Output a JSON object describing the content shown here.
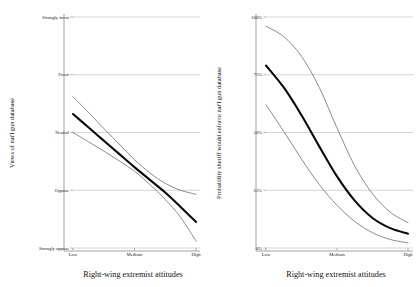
{
  "figure": {
    "background": "#ffffff",
    "fit_color": "#0b0b0b",
    "ci_color": "#7d7d7d",
    "grid_color": "#b9b9b9",
    "axis_color": "#8c8c8c"
  },
  "chart_data": [
    {
      "type": "line",
      "panel": "left",
      "title": "",
      "xlabel": "Right-wing extremist attitudes",
      "ylabel": "Views of nat'l gun database",
      "x": [
        "Low",
        "Medium",
        "High"
      ],
      "xticklabels": [
        "Low",
        "Medium",
        "High"
      ],
      "yticklabels": [
        "Strongly oppose",
        "Oppose",
        "Neutral",
        "Favor",
        "Strongly favor"
      ],
      "ytickvalues": [
        1,
        2,
        3,
        4,
        5
      ],
      "ylim": [
        1,
        5
      ],
      "xlim": [
        0,
        1
      ],
      "grid": "horizontal",
      "legend": "none",
      "series": [
        {
          "name": "Predicted views (fit)",
          "style": "solid-thick-black",
          "x": [
            0.0,
            0.125,
            0.25,
            0.375,
            0.5,
            0.625,
            0.75,
            0.875,
            1.0
          ],
          "values": [
            3.32,
            3.09,
            2.86,
            2.63,
            2.4,
            2.18,
            1.96,
            1.71,
            1.45
          ]
        },
        {
          "name": "95% CI upper",
          "style": "solid-thin-gray",
          "x": [
            0.0,
            0.125,
            0.25,
            0.375,
            0.5,
            0.625,
            0.75,
            0.875,
            1.0
          ],
          "values": [
            3.62,
            3.35,
            3.07,
            2.8,
            2.53,
            2.3,
            2.12,
            2.0,
            1.93
          ]
        },
        {
          "name": "95% CI lower",
          "style": "solid-thin-gray",
          "x": [
            0.0,
            0.125,
            0.25,
            0.375,
            0.5,
            0.625,
            0.75,
            0.875,
            1.0
          ],
          "values": [
            3.0,
            2.84,
            2.68,
            2.51,
            2.33,
            2.1,
            1.84,
            1.53,
            1.12
          ]
        }
      ]
    },
    {
      "type": "line",
      "panel": "right",
      "title": "",
      "xlabel": "Right-wing extremist attitudes",
      "ylabel": "Probability sheriff would enforce nat'l gun database",
      "x": [
        "Low",
        "Medium",
        "High"
      ],
      "xticklabels": [
        "Low",
        "Medium",
        "High"
      ],
      "yticklabels": [
        "0%",
        "25%",
        "50%",
        "75%",
        "100%"
      ],
      "ytickvalues": [
        0,
        25,
        50,
        75,
        100
      ],
      "ylim": [
        0,
        100
      ],
      "xlim": [
        0,
        1
      ],
      "grid": "horizontal",
      "legend": "none",
      "series": [
        {
          "name": "Predicted probability (fit)",
          "style": "solid-thick-black",
          "x": [
            0.0,
            0.125,
            0.25,
            0.375,
            0.5,
            0.625,
            0.75,
            0.875,
            1.0
          ],
          "values": [
            79.0,
            69.5,
            57.5,
            44.0,
            31.0,
            20.5,
            13.0,
            8.6,
            6.2
          ]
        },
        {
          "name": "95% CI upper",
          "style": "solid-thin-gray",
          "x": [
            0.0,
            0.125,
            0.25,
            0.375,
            0.5,
            0.625,
            0.75,
            0.875,
            1.0
          ],
          "values": [
            96.0,
            91.5,
            83.0,
            69.5,
            52.0,
            35.5,
            23.5,
            15.5,
            11.0
          ]
        },
        {
          "name": "95% CI lower",
          "style": "solid-thin-gray",
          "x": [
            0.0,
            0.125,
            0.25,
            0.375,
            0.5,
            0.625,
            0.75,
            0.875,
            1.0
          ],
          "values": [
            62.0,
            50.5,
            38.5,
            27.5,
            18.5,
            11.5,
            6.6,
            3.7,
            2.2
          ]
        }
      ]
    }
  ]
}
